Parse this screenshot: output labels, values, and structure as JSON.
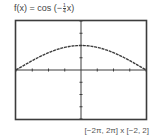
{
  "title": {
    "prefix": "f(x) = cos (−",
    "frac_num": "1",
    "frac_den": "4",
    "suffix": "x)"
  },
  "window_label": "[−2π, 2π] x [−2, 2]",
  "colors": {
    "frame": "#3c3c3c",
    "axes": "#3c3c3c",
    "curve": "#3c3c3c",
    "background": "#ffffff"
  },
  "chart_data": {
    "type": "line",
    "xlabel": "",
    "ylabel": "",
    "xlim": [
      -6.2832,
      6.2832
    ],
    "ylim": [
      -2,
      2
    ],
    "xscl": 1.5708,
    "yscl": 0.5,
    "grid": false,
    "legend": null,
    "annotations": [
      "[−2π, 2π] x [−2, 2]"
    ],
    "series": [
      {
        "name": "f(x) = cos(−x/4)",
        "x": [
          -6.2832,
          -5.4978,
          -4.7124,
          -3.927,
          -3.1416,
          -2.3562,
          -1.5708,
          -0.7854,
          0,
          0.7854,
          1.5708,
          2.3562,
          3.1416,
          3.927,
          4.7124,
          5.4978,
          6.2832
        ],
        "values": [
          0.0,
          0.1951,
          0.3827,
          0.5556,
          0.7071,
          0.8315,
          0.9239,
          0.9808,
          1.0,
          0.9808,
          0.9239,
          0.8315,
          0.7071,
          0.5556,
          0.3827,
          0.1951,
          0.0
        ]
      }
    ]
  }
}
